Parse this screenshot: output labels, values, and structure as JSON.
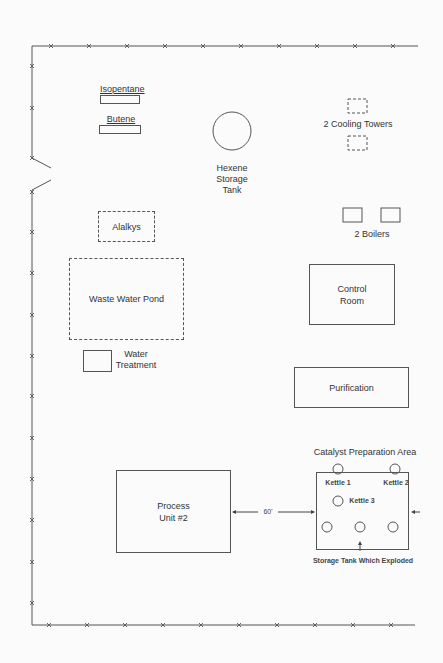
{
  "diagram": {
    "type": "facility site plan",
    "fence_marker": "x"
  },
  "labels": {
    "isopentane": "Isopentane",
    "butene": "Butene",
    "hexene": "Hexene",
    "hexene_line2": "Storage",
    "hexene_line3": "Tank",
    "cooling_towers": "2 Cooling Towers",
    "boilers": "2 Boilers",
    "alalkys": "Alalkys",
    "waste_water_pond": "Waste Water Pond",
    "control_room_line1": "Control",
    "control_room_line2": "Room",
    "water_treatment_line1": "Water",
    "water_treatment_line2": "Treatment",
    "purification": "Purification",
    "catalyst_area": "Catalyst Preparation Area",
    "kettle1": "Kettle 1",
    "kettle2": "Kettle 2",
    "kettle3": "Kettle 3",
    "process_unit_line1": "Process",
    "process_unit_line2": "Unit #2",
    "distance": "60'",
    "exploded_tank": "Storage Tank Which Exploded"
  },
  "colors": {
    "line": "#555555",
    "background": "#fbfbfb"
  }
}
